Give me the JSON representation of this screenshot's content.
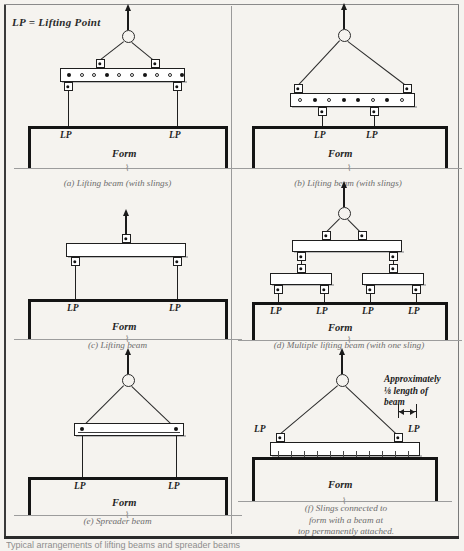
{
  "legend": {
    "text": "LP  =  Lifting Point"
  },
  "labels": {
    "lp": "LP",
    "form": "Form",
    "break_symbol": "⌇"
  },
  "panels": [
    {
      "id": "a",
      "caption": "(a) Lifting beam (with slings)",
      "type": "lifting-beam-with-slings",
      "beam_holes": [
        "filled",
        "open",
        "open",
        "filled",
        "open",
        "open",
        "filled",
        "open",
        "open",
        "filled"
      ],
      "top_lugs": "inset",
      "bottom_lugs": "ends",
      "lp_count": 2
    },
    {
      "id": "b",
      "caption": "(b) Lifting beam (with slings)",
      "type": "lifting-beam-with-slings",
      "beam_holes": [
        "open",
        "filled",
        "open",
        "filled",
        "filled",
        "open",
        "filled",
        "open"
      ],
      "top_lugs": "ends",
      "bottom_lugs": "inset",
      "lp_count": 2
    },
    {
      "id": "c",
      "caption": "(c) Lifting beam",
      "type": "lifting-beam",
      "top_lugs": "center",
      "bottom_lugs": "ends",
      "lp_count": 2
    },
    {
      "id": "d",
      "caption": "(d) Multiple lifting beam (with one sling)",
      "type": "multiple-lifting-beam",
      "top_lugs": "center",
      "bottom_lugs": "ends",
      "sub_beams": 2,
      "lp_count": 4
    },
    {
      "id": "e",
      "caption": "(e) Spreader beam",
      "type": "spreader-beam",
      "top_lugs": "ends",
      "bottom_lugs": "ends",
      "lp_count": 2
    },
    {
      "id": "f",
      "caption_lines": [
        "(f) Slings connected to",
        "form with a beam at",
        "top permanently attached."
      ],
      "type": "slings-to-permanent-beam",
      "note": "Approximately\n⅛ length of\nbeam",
      "lp_count": 2
    }
  ],
  "footer": {
    "text": "Typical arrangements of lifting beams and spreader beams"
  },
  "colors": {
    "ink": "#1f1f1f",
    "paper": "#f5f3ef",
    "caption": "#6d6d6d",
    "ground": "#9c9c9c"
  }
}
